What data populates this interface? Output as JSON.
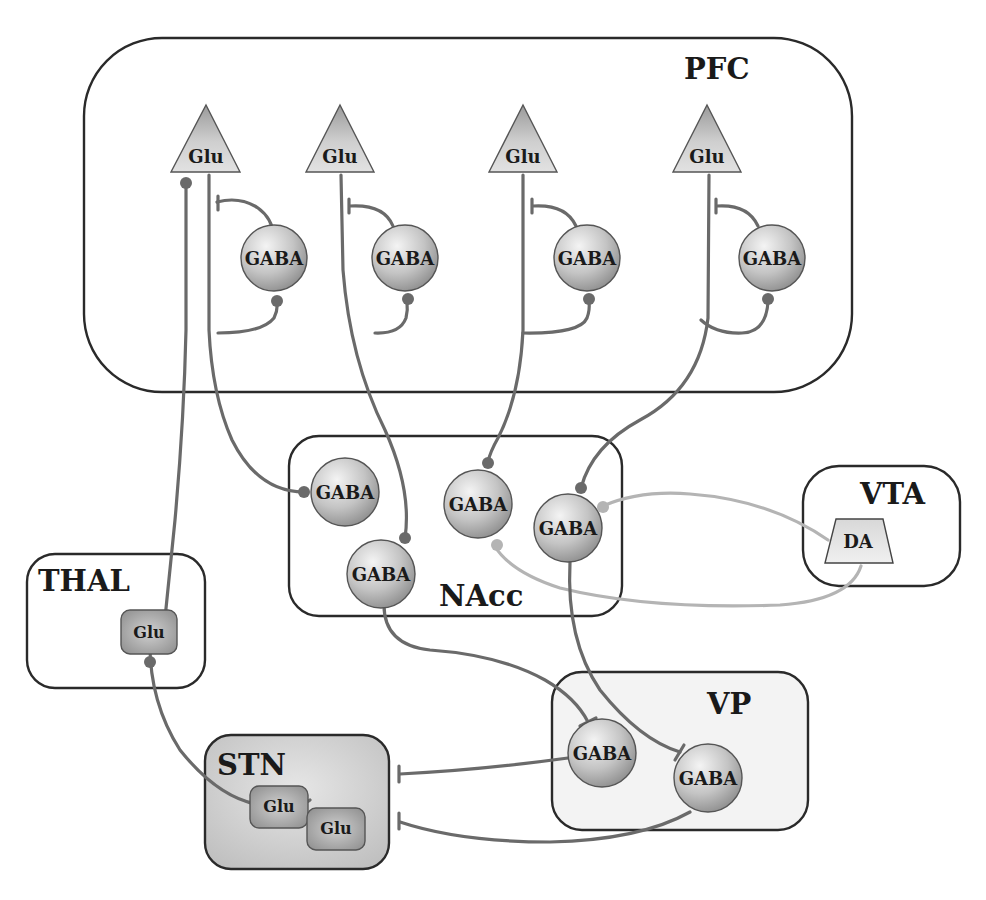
{
  "diagram": {
    "regions": [
      {
        "id": "pfc",
        "label": "PFC"
      },
      {
        "id": "nacc",
        "label": "NAcc"
      },
      {
        "id": "vta",
        "label": "VTA"
      },
      {
        "id": "thal",
        "label": "THAL"
      },
      {
        "id": "vp",
        "label": "VP"
      },
      {
        "id": "stn",
        "label": "STN"
      }
    ],
    "nodes": {
      "pfc_glu": [
        "Glu",
        "Glu",
        "Glu",
        "Glu"
      ],
      "pfc_gaba": [
        "GABA",
        "GABA",
        "GABA",
        "GABA"
      ],
      "nacc_gaba": [
        "GABA",
        "GABA",
        "GABA",
        "GABA"
      ],
      "vta_da": "DA",
      "thal_glu": "Glu",
      "vp_gaba": [
        "GABA",
        "GABA"
      ],
      "stn_glu": [
        "Glu",
        "Glu"
      ]
    },
    "connections": [
      {
        "from": "PFC GABA 1",
        "to": "PFC Glu 1",
        "type": "inhibitory"
      },
      {
        "from": "PFC Glu 1",
        "to": "PFC GABA 1",
        "type": "excitatory"
      },
      {
        "from": "PFC GABA 2",
        "to": "PFC Glu 2",
        "type": "inhibitory"
      },
      {
        "from": "PFC Glu 2",
        "to": "PFC GABA 2",
        "type": "excitatory"
      },
      {
        "from": "PFC GABA 3",
        "to": "PFC Glu 3",
        "type": "inhibitory"
      },
      {
        "from": "PFC Glu 3",
        "to": "PFC GABA 3",
        "type": "excitatory"
      },
      {
        "from": "PFC GABA 4",
        "to": "PFC Glu 4",
        "type": "inhibitory"
      },
      {
        "from": "PFC Glu 4",
        "to": "PFC GABA 4",
        "type": "excitatory"
      },
      {
        "from": "PFC Glu 1",
        "to": "NAcc GABA 1",
        "type": "excitatory"
      },
      {
        "from": "PFC Glu 2",
        "to": "NAcc GABA 4",
        "type": "excitatory"
      },
      {
        "from": "PFC Glu 3",
        "to": "NAcc GABA 2",
        "type": "excitatory"
      },
      {
        "from": "PFC Glu 4",
        "to": "NAcc GABA 3",
        "type": "excitatory"
      },
      {
        "from": "VTA DA",
        "to": "NAcc GABA 3",
        "type": "dopaminergic"
      },
      {
        "from": "VTA DA",
        "to": "NAcc GABA 2",
        "type": "dopaminergic"
      },
      {
        "from": "THAL Glu",
        "to": "PFC Glu 1",
        "type": "excitatory"
      },
      {
        "from": "STN Glu",
        "to": "THAL Glu",
        "type": "excitatory"
      },
      {
        "from": "NAcc GABA 4",
        "to": "VP GABA 1",
        "type": "inhibitory"
      },
      {
        "from": "NAcc GABA 3",
        "to": "VP GABA 2",
        "type": "inhibitory"
      },
      {
        "from": "VP GABA 1",
        "to": "STN",
        "type": "inhibitory"
      },
      {
        "from": "VP GABA 2",
        "to": "STN",
        "type": "inhibitory"
      }
    ],
    "colors": {
      "axon": "#6a6a6a",
      "dopamine_axon": "#b4b4b4",
      "region_border": "#2a2a2a",
      "node_fill": "#c8c8c8",
      "stn_fill": "#d4d4d4",
      "vp_fill": "#f2f2f2"
    }
  }
}
